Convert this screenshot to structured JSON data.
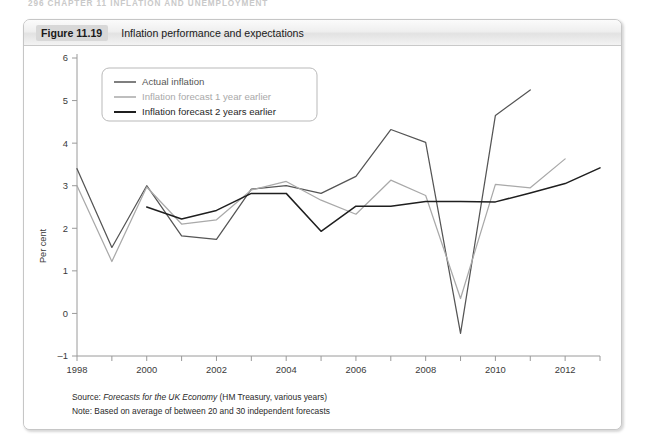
{
  "running_head": "296  CHAPTER 11  INFLATION AND UNEMPLOYMENT",
  "figure": {
    "number": "Figure 11.19",
    "title": "Inflation performance and expectations"
  },
  "caption": {
    "source_label": "Source: ",
    "source_italic": "Forecasts for the UK Economy",
    "source_rest": " (HM Treasury, various years)",
    "note": "Note: Based on average of between 20 and 30 independent forecasts"
  },
  "colors": {
    "actual": "#555555",
    "forecast_1yr": "#a9a9a9",
    "forecast_2yr": "#1f1f1f",
    "axis": "#9a9a9a",
    "frame": "#c6c6c6",
    "header_band": "#d8d8d8"
  },
  "chart_data": {
    "type": "line",
    "title": "Inflation performance and expectations",
    "xlabel": "",
    "ylabel": "Per cent",
    "xlim": [
      1998,
      2013
    ],
    "ylim": [
      -1,
      6
    ],
    "ytick_values": [
      -1,
      0,
      1,
      2,
      3,
      4,
      5,
      6
    ],
    "ytick_labels": [
      "–1",
      "0",
      "1",
      "2",
      "3",
      "4",
      "5",
      "6"
    ],
    "xtick_values": [
      1998,
      1999,
      2000,
      2001,
      2002,
      2003,
      2004,
      2005,
      2006,
      2007,
      2008,
      2009,
      2010,
      2011,
      2012,
      2013
    ],
    "xtick_labels_shown": [
      "1998",
      "2000",
      "2002",
      "2004",
      "2006",
      "2008",
      "2010",
      "2012"
    ],
    "xtick_label_values": [
      1998,
      2000,
      2002,
      2004,
      2006,
      2008,
      2010,
      2012
    ],
    "grid": false,
    "legend_position": "upper-left-inside",
    "series": [
      {
        "name": "Actual inflation",
        "color": "#555555",
        "x": [
          1998,
          1999,
          2000,
          2001,
          2002,
          2003,
          2004,
          2005,
          2006,
          2007,
          2008,
          2009,
          2010,
          2011
        ],
        "values": [
          3.4,
          1.55,
          3.0,
          1.82,
          1.74,
          2.92,
          3.0,
          2.82,
          3.22,
          4.32,
          4.02,
          -0.47,
          4.65,
          5.25
        ]
      },
      {
        "name": "Inflation forecast 1 year earlier",
        "color": "#a9a9a9",
        "x": [
          1998,
          1999,
          2000,
          2001,
          2002,
          2003,
          2004,
          2005,
          2006,
          2007,
          2008,
          2009,
          2010,
          2011,
          2012
        ],
        "values": [
          3.0,
          1.22,
          2.97,
          2.1,
          2.2,
          2.9,
          3.1,
          2.66,
          2.33,
          3.13,
          2.77,
          0.35,
          3.03,
          2.95,
          3.63
        ]
      },
      {
        "name": "Inflation forecast 2 years earlier",
        "color": "#1f1f1f",
        "x": [
          2000,
          2001,
          2002,
          2003,
          2004,
          2005,
          2006,
          2007,
          2008,
          2009,
          2010,
          2011,
          2012,
          2013
        ],
        "values": [
          2.5,
          2.22,
          2.42,
          2.82,
          2.82,
          1.93,
          2.52,
          2.52,
          2.63,
          2.63,
          2.62,
          2.83,
          3.05,
          3.42
        ]
      }
    ]
  }
}
